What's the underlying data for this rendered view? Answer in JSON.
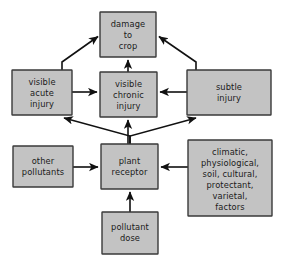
{
  "diagram": {
    "background_color": "#ffffff",
    "node_fill_color": "#c3c3c3",
    "node_border_color": "#3a3a3a",
    "arrow_color": "#111111",
    "nodes": [
      {
        "id": "damage-to-crop",
        "lines": [
          "damage",
          "to",
          "crop"
        ],
        "x": 100,
        "y": 12,
        "w": 56,
        "h": 45
      },
      {
        "id": "visible-acute-injury",
        "lines": [
          "visible",
          "acute",
          "injury"
        ],
        "x": 12,
        "y": 70,
        "w": 60,
        "h": 45
      },
      {
        "id": "visible-chronic-injury",
        "lines": [
          "visible",
          "chronic",
          "injury"
        ],
        "x": 100,
        "y": 72,
        "w": 57,
        "h": 45
      },
      {
        "id": "subtle-injury",
        "lines": [
          "subtle",
          "injury"
        ],
        "x": 187,
        "y": 70,
        "w": 84,
        "h": 45
      },
      {
        "id": "other-pollutants",
        "lines": [
          "other",
          "pollutants"
        ],
        "x": 13,
        "y": 146,
        "w": 60,
        "h": 41
      },
      {
        "id": "plant-receptor",
        "lines": [
          "plant",
          "receptor"
        ],
        "x": 101,
        "y": 144,
        "w": 57,
        "h": 45
      },
      {
        "id": "modifying-factors",
        "lines": [
          "climatic,",
          "physiological,",
          "soil, cultural,",
          "protectant,",
          "varietal,",
          "factors"
        ],
        "x": 188,
        "y": 140,
        "w": 84,
        "h": 76
      },
      {
        "id": "pollutant-dose",
        "lines": [
          "pollutant",
          "dose"
        ],
        "x": 102,
        "y": 212,
        "w": 56,
        "h": 42
      }
    ],
    "edges": [
      {
        "id": "acute-to-damage",
        "from": "visible-acute-injury",
        "to": "damage-to-crop",
        "kind": "diagonal"
      },
      {
        "id": "chronic-to-damage",
        "from": "visible-chronic-injury",
        "to": "damage-to-crop",
        "kind": "vertical"
      },
      {
        "id": "subtle-to-damage",
        "from": "subtle-injury",
        "to": "damage-to-crop",
        "kind": "diagonal"
      },
      {
        "id": "acute-to-chronic",
        "from": "visible-acute-injury",
        "to": "visible-chronic-injury",
        "kind": "horizontal"
      },
      {
        "id": "subtle-to-chronic",
        "from": "subtle-injury",
        "to": "visible-chronic-injury",
        "kind": "horizontal"
      },
      {
        "id": "receptor-to-acute",
        "from": "plant-receptor",
        "to": "visible-acute-injury",
        "kind": "diagonal"
      },
      {
        "id": "receptor-to-chronic",
        "from": "plant-receptor",
        "to": "visible-chronic-injury",
        "kind": "vertical"
      },
      {
        "id": "receptor-to-subtle",
        "from": "plant-receptor",
        "to": "subtle-injury",
        "kind": "diagonal"
      },
      {
        "id": "pollutants-to-receptor",
        "from": "other-pollutants",
        "to": "plant-receptor",
        "kind": "horizontal"
      },
      {
        "id": "factors-to-receptor",
        "from": "modifying-factors",
        "to": "plant-receptor",
        "kind": "horizontal"
      },
      {
        "id": "dose-to-receptor",
        "from": "pollutant-dose",
        "to": "plant-receptor",
        "kind": "vertical"
      }
    ]
  }
}
